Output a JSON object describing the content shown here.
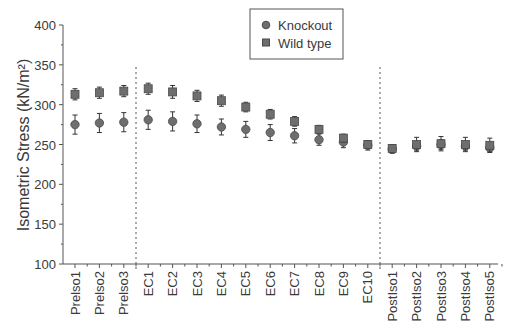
{
  "chart_data": {
    "type": "scatter",
    "title": "",
    "xlabel": "",
    "ylabel": "Isometric Stress (kN/m²)",
    "ylim": [
      100,
      400
    ],
    "yticks": [
      100,
      150,
      200,
      250,
      300,
      350,
      400
    ],
    "grid": false,
    "legend_position": "top-center",
    "categories": [
      "PreIso1",
      "PreIso2",
      "PreIso3",
      "EC1",
      "EC2",
      "EC3",
      "EC4",
      "EC5",
      "EC6",
      "EC7",
      "EC8",
      "EC9",
      "EC10",
      "PostIso1",
      "PostIso2",
      "PostIso3",
      "PostIso4",
      "PostIso5"
    ],
    "category_labels": [
      "Prelso1",
      "Prelso2",
      "Prelso3",
      "EC1",
      "EC2",
      "EC3",
      "EC4",
      "EC5",
      "EC6",
      "EC7",
      "EC8",
      "EC9",
      "EC10",
      "PostIso1",
      "PostIso2",
      "PostIso3",
      "PostIso4",
      "PostIso5"
    ],
    "dividers_after": [
      "PreIso3",
      "EC10"
    ],
    "series": [
      {
        "name": "Knockout",
        "marker": "circle",
        "values": [
          275,
          277,
          278,
          281,
          279,
          276,
          272,
          269,
          265,
          261,
          256,
          253,
          249,
          244,
          248,
          250,
          248,
          246
        ],
        "errors": [
          12,
          12,
          12,
          12,
          12,
          11,
          10,
          10,
          10,
          9,
          7,
          7,
          6,
          5,
          5,
          6,
          5,
          5
        ]
      },
      {
        "name": "Wild type",
        "marker": "square",
        "values": [
          313,
          315,
          317,
          320,
          316,
          311,
          305,
          297,
          288,
          279,
          269,
          258,
          250,
          245,
          250,
          251,
          250,
          249
        ],
        "errors": [
          7,
          7,
          7,
          7,
          8,
          7,
          7,
          6,
          6,
          6,
          5,
          5,
          5,
          5,
          9,
          9,
          9,
          9
        ]
      }
    ]
  },
  "colors": {
    "marker_fill": "#6e6e6e",
    "marker_stroke": "#4a4a4a",
    "axis": "#555555",
    "text": "#3a3a3a"
  }
}
